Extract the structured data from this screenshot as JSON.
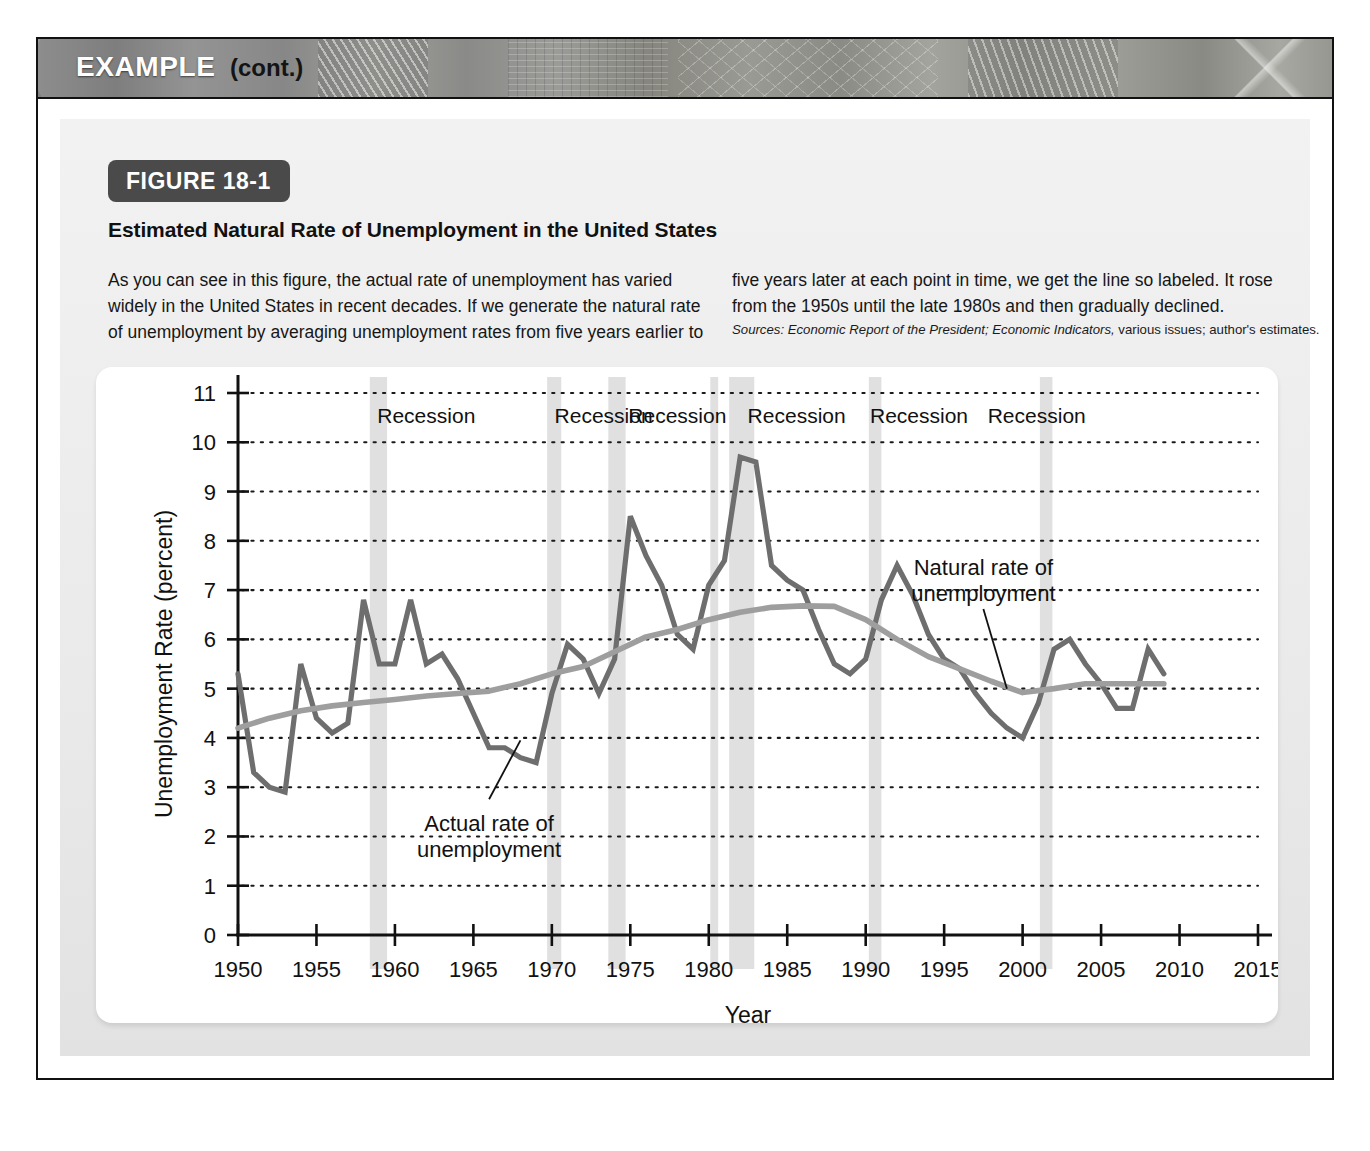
{
  "example": {
    "title": "EXAMPLE",
    "cont_label": "(cont.)"
  },
  "figure": {
    "tag": "FIGURE 18-1",
    "heading": "Estimated Natural Rate of Unemployment in the United States",
    "caption_left": "As you can see in this figure, the actual rate of unemployment has varied widely in the United States in recent decades. If we generate the natural rate of unemployment by averaging unemployment rates from five years earlier to",
    "caption_right": "five years later at each point in time, we get the line so labeled. It rose from the 1950s until the late 1980s and then gradually declined.",
    "sources_prefix": "Sources:",
    "sources_italic_1": "Economic Report of the President;",
    "sources_italic_2": "Economic Indicators,",
    "sources_rest": "various issues; author's estimates."
  },
  "colors": {
    "actual_line": "#6e6e6e",
    "natural_line": "#9e9e9e",
    "recession_band": "#e0e0e0",
    "axis": "#111111",
    "grid": "#1a1a1a",
    "panel_bg": "#ededed",
    "card_bg": "#ffffff",
    "tag_bg": "#4a4a4a"
  },
  "chart_data": {
    "type": "line",
    "title": "Estimated Natural Rate of Unemployment in the United States",
    "xlabel": "Year",
    "ylabel": "Unemployment Rate (percent)",
    "xlim": [
      1950,
      2015
    ],
    "ylim": [
      0,
      11
    ],
    "xticks": [
      1950,
      1955,
      1960,
      1965,
      1970,
      1975,
      1980,
      1985,
      1990,
      1995,
      2000,
      2005,
      2010,
      2015
    ],
    "xtick_labels": [
      "1950",
      "1955",
      "1960",
      "1965",
      "1970",
      "1975",
      "1980",
      "1985",
      "1990",
      "1995",
      "2000",
      "2005",
      "2010",
      "2015"
    ],
    "yticks": [
      0,
      1,
      2,
      3,
      4,
      5,
      6,
      7,
      8,
      9,
      10,
      11
    ],
    "ytick_labels": [
      "0",
      "1",
      "2",
      "3",
      "4",
      "5",
      "6",
      "7",
      "8",
      "9",
      "10",
      "11"
    ],
    "grid": "horizontal-dotted",
    "legend": "inline-annotations",
    "annotations": [
      {
        "name": "actual-rate-annotation",
        "label_line1": "Actual rate of",
        "label_line2": "unemployment",
        "x": 1966.0,
        "y": 2.35,
        "leader_to_x": 1968.0,
        "leader_to_y": 3.95
      },
      {
        "name": "natural-rate-annotation",
        "label_line1": "Natural rate of",
        "label_line2": "unemployment",
        "x": 1997.5,
        "y": 7.55,
        "leader_to_x": 1999.0,
        "leader_to_y": 5.0
      }
    ],
    "recessions": [
      {
        "label": "Recession",
        "start": 1958.4,
        "end": 1959.5,
        "label_x": 1962.0
      },
      {
        "label": "Recession",
        "start": 1969.7,
        "end": 1970.6,
        "label_x": 1973.3
      },
      {
        "label": "Recession",
        "start": 1973.6,
        "end": 1974.7,
        "label_x": 1978.0
      },
      {
        "label": "Recession",
        "start": 1980.1,
        "end": 1980.6,
        "label_x": 1985.6
      },
      {
        "label": "",
        "start": 1981.3,
        "end": 1982.9,
        "label_x": null
      },
      {
        "label": "Recession",
        "start": 1990.2,
        "end": 1991.0,
        "label_x": 1993.4
      },
      {
        "label": "Recession",
        "start": 2001.1,
        "end": 2001.9,
        "label_x": 2000.9
      }
    ],
    "recession_label_y": 10.55,
    "series": [
      {
        "name": "Actual rate of unemployment",
        "color": "#6e6e6e",
        "x": [
          1950,
          1951,
          1952,
          1953,
          1954,
          1955,
          1956,
          1957,
          1958,
          1959,
          1960,
          1961,
          1962,
          1963,
          1964,
          1965,
          1966,
          1967,
          1968,
          1969,
          1970,
          1971,
          1972,
          1973,
          1974,
          1975,
          1976,
          1977,
          1978,
          1979,
          1980,
          1981,
          1982,
          1983,
          1984,
          1985,
          1986,
          1987,
          1988,
          1989,
          1990,
          1991,
          1992,
          1993,
          1994,
          1995,
          1996,
          1997,
          1998,
          1999,
          2000,
          2001,
          2002,
          2003,
          2004,
          2005,
          2006,
          2007,
          2008,
          2009
        ],
        "y": [
          5.3,
          3.3,
          3.0,
          2.9,
          5.5,
          4.4,
          4.1,
          4.3,
          6.8,
          5.5,
          5.5,
          6.8,
          5.5,
          5.7,
          5.2,
          4.5,
          3.8,
          3.8,
          3.6,
          3.5,
          4.9,
          5.9,
          5.6,
          4.9,
          5.6,
          8.5,
          7.7,
          7.1,
          6.1,
          5.8,
          7.1,
          7.6,
          9.7,
          9.6,
          7.5,
          7.2,
          7.0,
          6.2,
          5.5,
          5.3,
          5.6,
          6.8,
          7.5,
          6.9,
          6.1,
          5.6,
          5.4,
          4.9,
          4.5,
          4.2,
          4.0,
          4.7,
          5.8,
          6.0,
          5.5,
          5.1,
          4.6,
          4.6,
          5.8,
          5.3
        ]
      },
      {
        "name": "Natural rate of unemployment",
        "color": "#9e9e9e",
        "x": [
          1950,
          1952,
          1954,
          1956,
          1958,
          1960,
          1962,
          1964,
          1966,
          1968,
          1970,
          1972,
          1974,
          1976,
          1978,
          1980,
          1982,
          1984,
          1986,
          1988,
          1990,
          1992,
          1994,
          1996,
          1998,
          2000,
          2002,
          2004,
          2006,
          2008,
          2009
        ],
        "y": [
          4.2,
          4.4,
          4.55,
          4.65,
          4.72,
          4.78,
          4.85,
          4.9,
          4.95,
          5.1,
          5.3,
          5.45,
          5.75,
          6.05,
          6.2,
          6.4,
          6.55,
          6.65,
          6.68,
          6.67,
          6.4,
          6.0,
          5.65,
          5.4,
          5.15,
          4.92,
          5.0,
          5.1,
          5.1,
          5.1,
          5.1
        ]
      }
    ]
  }
}
